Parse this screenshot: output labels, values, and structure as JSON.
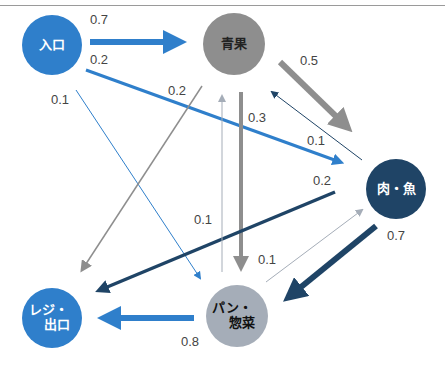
{
  "diagram": {
    "type": "transition-graph",
    "colors": {
      "entrance": "#2f7fcb",
      "vegetables": "#8e8e8e",
      "meat_fish": "#1f4466",
      "bread_deli": "#a5adb8",
      "checkout": "#2f7fcb"
    },
    "nodes": [
      {
        "id": "entrance",
        "label": "入口"
      },
      {
        "id": "vegetables",
        "label": "青果"
      },
      {
        "id": "meat_fish",
        "label": "肉・魚"
      },
      {
        "id": "bread_deli",
        "label_line1": "パン・",
        "label_line2": "惣菜"
      },
      {
        "id": "checkout",
        "label_line1": "レジ・",
        "label_line2": "出口"
      }
    ],
    "edges": [
      {
        "from": "entrance",
        "to": "vegetables",
        "weight": "0.7"
      },
      {
        "from": "entrance",
        "to": "meat_fish",
        "weight": "0.2"
      },
      {
        "from": "entrance",
        "to": "bread_deli",
        "weight": "0.1"
      },
      {
        "from": "vegetables",
        "to": "meat_fish",
        "weight": "0.5"
      },
      {
        "from": "vegetables",
        "to": "bread_deli",
        "weight": "0.3"
      },
      {
        "from": "vegetables",
        "to": "checkout",
        "weight": "0.2"
      },
      {
        "from": "meat_fish",
        "to": "vegetables",
        "weight": "0.1"
      },
      {
        "from": "meat_fish",
        "to": "checkout",
        "weight": "0.2"
      },
      {
        "from": "meat_fish",
        "to": "bread_deli",
        "weight": "0.7"
      },
      {
        "from": "bread_deli",
        "to": "vegetables",
        "weight": "0.1"
      },
      {
        "from": "bread_deli",
        "to": "meat_fish",
        "weight": "0.1"
      },
      {
        "from": "bread_deli",
        "to": "checkout",
        "weight": "0.8"
      }
    ]
  }
}
